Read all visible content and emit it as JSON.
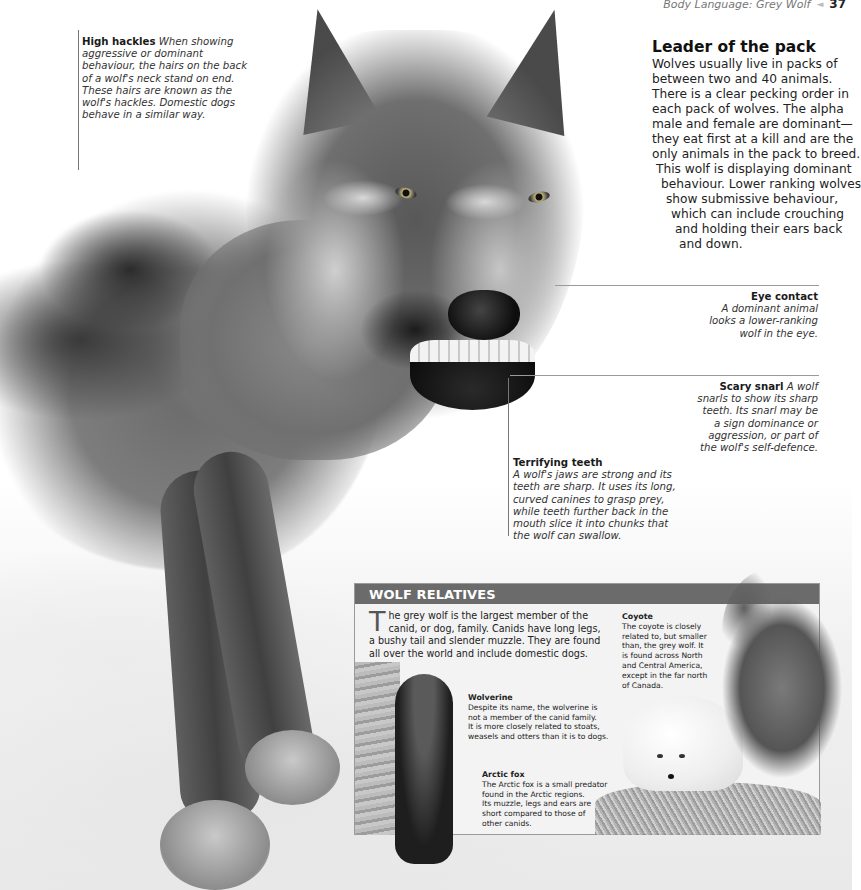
{
  "running_header": {
    "section": "Body Language: Grey Wolf",
    "arrow": "◄",
    "page_number": "37"
  },
  "captions": {
    "high_hackles": {
      "title": "High hackles",
      "body": "When showing aggressive or dominant behaviour, the hairs on the back of a wolf's neck stand on end. These hairs are known as the wolf's hackles. Domestic dogs behave in a similar way.",
      "lines": [
        "aggressive or dominant",
        "behaviour, the hairs on the back",
        "of a wolf's neck stand on end.",
        "These hairs are known as the",
        "wolf's hackles. Domestic dogs",
        "behave in a similar way."
      ],
      "first_line_body": "When showing"
    },
    "eye_contact": {
      "title": "Eye contact",
      "lines": [
        "A dominant animal",
        "looks a lower-ranking",
        "wolf in the eye."
      ]
    },
    "scary_snarl": {
      "title": "Scary snarl",
      "first_line_body": "A wolf",
      "lines": [
        "snarls to show its sharp",
        "teeth. Its snarl may be",
        "a sign dominance or",
        "aggression, or part of",
        "the wolf's self-defence."
      ]
    },
    "terrifying_teeth": {
      "title": "Terrifying teeth",
      "lines": [
        "A wolf's jaws are strong and its",
        "teeth are sharp. It uses its long,",
        "curved canines to grasp prey,",
        "while teeth further back in the",
        "mouth slice it into chunks that",
        "the wolf can swallow."
      ]
    }
  },
  "leader_of_the_pack": {
    "title": "Leader of the pack",
    "lines": [
      "Wolves usually live in packs of",
      "between two and 40 animals.",
      "There is a clear pecking order in",
      "each pack of wolves. The alpha",
      "male and female are dominant—",
      "they eat first at a kill and are the",
      "only animals in the pack to breed.",
      "This wolf is displaying dominant",
      "behaviour. Lower ranking wolves",
      "show submissive behaviour,",
      "which can include crouching",
      "and holding their ears back",
      "and down."
    ]
  },
  "wolf_relatives": {
    "header": "WOLF RELATIVES",
    "intro": {
      "drop_cap": "T",
      "text": "he grey wolf is the largest member of the canid, or dog, family. Canids have long legs, a bushy tail and slender muzzle. They are found all over the world and include domestic dogs."
    },
    "entries": [
      {
        "name": "Coyote",
        "lines": [
          "The coyote is closely",
          "related to, but smaller",
          "than, the grey wolf. It",
          "is found across North",
          "and Central America,",
          "except in the far north",
          "of Canada."
        ]
      },
      {
        "name": "Wolverine",
        "lines": [
          "Despite its name, the wolverine is",
          "not a member of the canid family.",
          "It is more closely related to stoats,",
          "weasels and otters than it is to dogs."
        ]
      },
      {
        "name": "Arctic fox",
        "lines": [
          "The Arctic fox is a small predator",
          "found in the Arctic regions.",
          "Its muzzle, legs and ears are",
          "short compared to those of",
          "other canids."
        ]
      }
    ]
  },
  "images": {
    "main": "grey-wolf-snarling-photo",
    "coyote": "howling-coyote-photo",
    "wolverine": "wolverine-on-tree-photo",
    "arctic_fox": "arctic-fox-photo"
  },
  "colors": {
    "panel_header": "#6b6b6b",
    "panel_bg": "#f3f3f3",
    "text": "#1c1c1c",
    "rule": "#9a9a9a"
  }
}
